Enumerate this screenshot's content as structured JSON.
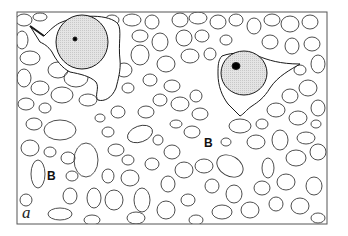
{
  "figure": {
    "panel_label": "a",
    "region_labels": [
      {
        "text": "B",
        "x": 209,
        "y": 143
      },
      {
        "text": "B",
        "x": 52,
        "y": 175
      }
    ],
    "frame": {
      "x": 17,
      "y": 12,
      "width": 310,
      "height": 212
    },
    "colors": {
      "outline": "#3a3a3a",
      "nucleus_fill": "#dcdcdc",
      "nucleolus": "#000000",
      "background": "#ffffff"
    },
    "cells": [
      {
        "name": "neuron-left",
        "nucleus": {
          "cx": 82,
          "cy": 42,
          "rx": 26,
          "ry": 27
        },
        "nucleolus": {
          "cx": 75,
          "cy": 39,
          "r": 2
        }
      },
      {
        "name": "neuron-right",
        "nucleus": {
          "cx": 244,
          "cy": 73,
          "rx": 23,
          "ry": 22
        },
        "nucleolus": {
          "cx": 236,
          "cy": 66,
          "rx": 4,
          "ry": 3.5
        }
      }
    ]
  }
}
